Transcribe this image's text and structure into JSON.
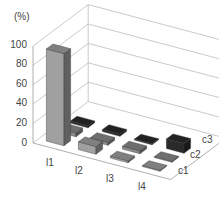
{
  "chart_data": {
    "type": "bar",
    "subtype": "3d-column",
    "title": "",
    "ylabel": "(%)",
    "xlabel": "",
    "ylim": [
      0,
      100
    ],
    "yticks": [
      0,
      20,
      40,
      60,
      80,
      100
    ],
    "categories": [
      "l1",
      "l2",
      "l3",
      "l4"
    ],
    "depth_categories": [
      "c1",
      "c2",
      "c3"
    ],
    "series": [
      {
        "name": "c1",
        "color": "#a0a0a0",
        "values": [
          95,
          8,
          2,
          1
        ]
      },
      {
        "name": "c2",
        "color": "#8a8a8a",
        "values": [
          4,
          3,
          3,
          1
        ]
      },
      {
        "name": "c3",
        "color": "#2a2a2a",
        "values": [
          2,
          2,
          1,
          10
        ]
      }
    ],
    "grid": true,
    "legend": "none"
  },
  "axis": {
    "y_unit": "(%)",
    "y_ticks": [
      "0",
      "20",
      "40",
      "60",
      "80",
      "100"
    ],
    "x_ticks": [
      "l1",
      "l2",
      "l3",
      "l4"
    ],
    "z_ticks": [
      "c1",
      "c2",
      "c3"
    ]
  }
}
